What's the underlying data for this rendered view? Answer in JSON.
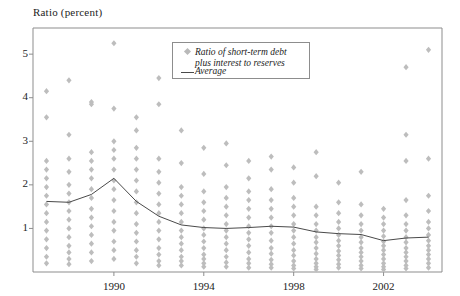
{
  "chart_data": {
    "type": "scatter",
    "title": "Ratio (percent)",
    "xlabel": "",
    "ylabel": "Ratio (percent)",
    "xlim": [
      1986.4,
      2004.6
    ],
    "ylim": [
      0,
      5.6
    ],
    "yticks": [
      1,
      2,
      3,
      4,
      5
    ],
    "xticks": [
      1990,
      1994,
      1998,
      2002
    ],
    "xtick_labels": [
      "1990",
      "1994",
      "1998",
      "2002"
    ],
    "ytick_labels": [
      "1",
      "2",
      "3",
      "4",
      "5"
    ],
    "grid": false,
    "legend_position": "top-right",
    "marker_color": "#bdbdbd",
    "line_color": "#4a4a4a",
    "frame_color": "#8d8d8d",
    "legend": [
      {
        "key": "scatter",
        "label": "Ratio of short-term debt\nplus interest to reserves"
      },
      {
        "key": "line",
        "label": "Average"
      }
    ],
    "series": [
      {
        "name": "Ratio of short-term debt plus interest to reserves",
        "type": "scatter",
        "points_by_year": [
          {
            "x": 1987,
            "values": [
              4.15,
              3.55,
              2.55,
              2.35,
              2.15,
              1.95,
              1.75,
              1.55,
              1.35,
              1.15,
              0.95,
              0.75,
              0.55,
              0.35,
              0.2
            ]
          },
          {
            "x": 1988,
            "values": [
              4.4,
              3.15,
              2.6,
              2.3,
              2.0,
              1.8,
              1.6,
              1.4,
              1.2,
              1.0,
              0.8,
              0.6,
              0.45,
              0.3,
              0.18
            ]
          },
          {
            "x": 1989,
            "values": [
              3.9,
              3.85,
              2.75,
              2.55,
              2.35,
              2.15,
              1.9,
              1.7,
              1.45,
              1.25,
              1.05,
              0.85,
              0.65,
              0.45,
              0.25
            ]
          },
          {
            "x": 1990,
            "values": [
              5.25,
              3.75,
              3.0,
              2.8,
              2.6,
              2.35,
              2.1,
              1.9,
              1.65,
              1.4,
              1.15,
              0.95,
              0.7,
              0.5,
              0.3
            ]
          },
          {
            "x": 1991,
            "values": [
              3.55,
              3.25,
              2.85,
              2.6,
              2.35,
              2.1,
              1.85,
              1.6,
              1.35,
              1.1,
              0.9,
              0.7,
              0.5,
              0.35,
              0.2
            ]
          },
          {
            "x": 1992,
            "values": [
              4.45,
              3.85,
              2.6,
              2.3,
              2.05,
              1.8,
              1.55,
              1.35,
              1.15,
              0.95,
              0.75,
              0.55,
              0.4,
              0.25,
              0.15
            ]
          },
          {
            "x": 1993,
            "values": [
              3.25,
              2.5,
              1.95,
              1.75,
              1.55,
              1.35,
              1.15,
              0.95,
              0.8,
              0.65,
              0.5,
              0.35,
              0.25,
              0.15
            ]
          },
          {
            "x": 1994,
            "values": [
              2.85,
              2.25,
              1.85,
              1.6,
              1.4,
              1.2,
              1.0,
              0.85,
              0.7,
              0.55,
              0.4,
              0.3,
              0.2,
              0.12
            ]
          },
          {
            "x": 1995,
            "values": [
              2.95,
              2.45,
              1.95,
              1.7,
              1.5,
              1.3,
              1.1,
              0.95,
              0.8,
              0.65,
              0.5,
              0.35,
              0.22,
              0.12
            ]
          },
          {
            "x": 1996,
            "values": [
              2.55,
              2.15,
              1.85,
              1.65,
              1.45,
              1.25,
              1.05,
              0.9,
              0.75,
              0.6,
              0.45,
              0.3,
              0.2,
              0.1
            ]
          },
          {
            "x": 1997,
            "values": [
              2.65,
              2.35,
              1.9,
              1.65,
              1.45,
              1.25,
              1.05,
              0.9,
              0.72,
              0.55,
              0.42,
              0.28,
              0.18,
              0.1
            ]
          },
          {
            "x": 1998,
            "values": [
              2.4,
              2.05,
              1.7,
              1.5,
              1.3,
              1.1,
              0.95,
              0.8,
              0.65,
              0.5,
              0.38,
              0.25,
              0.15,
              0.08
            ]
          },
          {
            "x": 1999,
            "values": [
              2.75,
              2.2,
              1.5,
              1.3,
              1.1,
              0.95,
              0.8,
              0.68,
              0.55,
              0.42,
              0.3,
              0.2,
              0.12,
              0.06
            ]
          },
          {
            "x": 2000,
            "values": [
              2.05,
              1.6,
              1.35,
              1.15,
              1.0,
              0.85,
              0.72,
              0.6,
              0.48,
              0.38,
              0.28,
              0.18,
              0.1
            ]
          },
          {
            "x": 2001,
            "values": [
              2.3,
              1.55,
              1.3,
              1.1,
              0.95,
              0.8,
              0.68,
              0.55,
              0.45,
              0.35,
              0.25,
              0.15,
              0.08
            ]
          },
          {
            "x": 2002,
            "values": [
              1.45,
              1.25,
              1.1,
              0.95,
              0.82,
              0.7,
              0.6,
              0.5,
              0.4,
              0.3,
              0.2,
              0.12,
              0.06
            ]
          },
          {
            "x": 2003,
            "values": [
              4.7,
              3.15,
              2.55,
              1.65,
              1.3,
              1.1,
              0.95,
              0.8,
              0.68,
              0.55,
              0.45,
              0.35,
              0.25,
              0.15,
              0.08
            ]
          },
          {
            "x": 2004,
            "values": [
              5.1,
              2.6,
              1.75,
              1.4,
              1.15,
              1.0,
              0.85,
              0.72,
              0.6,
              0.5,
              0.4,
              0.3,
              0.2,
              0.1
            ]
          }
        ]
      },
      {
        "name": "Average",
        "type": "line",
        "x": [
          1987,
          1988,
          1989,
          1990,
          1991,
          1992,
          1993,
          1994,
          1995,
          1996,
          1997,
          1998,
          1999,
          2000,
          2001,
          2002,
          2003,
          2004
        ],
        "values": [
          1.62,
          1.6,
          1.78,
          2.15,
          1.62,
          1.28,
          1.08,
          1.02,
          1.0,
          1.02,
          1.05,
          1.03,
          0.92,
          0.88,
          0.86,
          0.72,
          0.78,
          0.8
        ]
      }
    ]
  }
}
